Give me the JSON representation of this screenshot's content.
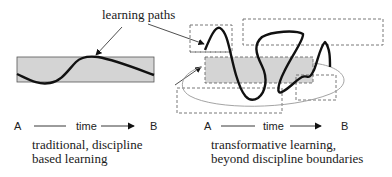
{
  "annotation": {
    "label": "learning paths"
  },
  "left_diagram": {
    "axis": {
      "start": "A",
      "label": "time",
      "end": "B"
    },
    "caption": [
      "traditional, discipline",
      "based learning"
    ]
  },
  "right_diagram": {
    "axis": {
      "start": "A",
      "label": "time",
      "end": "B"
    },
    "caption": [
      "transformative learning,",
      "beyond discipline boundaries"
    ]
  },
  "colors": {
    "band_fill": "#d4d4d4",
    "path_stroke": "#111111",
    "dashed_stroke": "#6a6a6a"
  }
}
